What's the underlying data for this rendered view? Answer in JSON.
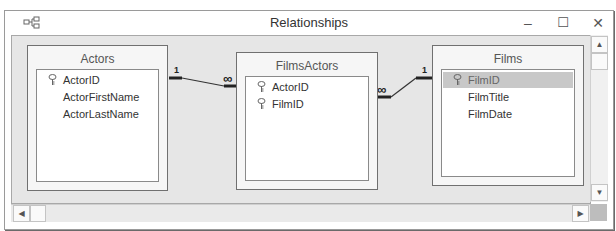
{
  "window": {
    "title": "Relationships",
    "icon": "relationships-icon",
    "controls": {
      "minimize": "–",
      "maximize": "☐",
      "close": "✕"
    }
  },
  "tables": [
    {
      "name": "Actors",
      "fields": [
        {
          "name": "ActorID",
          "primary_key": true,
          "selected": false
        },
        {
          "name": "ActorFirstName",
          "primary_key": false,
          "selected": false
        },
        {
          "name": "ActorLastName",
          "primary_key": false,
          "selected": false
        }
      ]
    },
    {
      "name": "FilmsActors",
      "fields": [
        {
          "name": "ActorID",
          "primary_key": true,
          "selected": false
        },
        {
          "name": "FilmID",
          "primary_key": true,
          "selected": false
        }
      ]
    },
    {
      "name": "Films",
      "fields": [
        {
          "name": "FilmID",
          "primary_key": true,
          "selected": true
        },
        {
          "name": "FilmTitle",
          "primary_key": false,
          "selected": false
        },
        {
          "name": "FilmDate",
          "primary_key": false,
          "selected": false
        }
      ]
    }
  ],
  "relationships": [
    {
      "from": "Actors.ActorID",
      "to": "FilmsActors.ActorID",
      "from_label": "1",
      "to_label": "∞"
    },
    {
      "from": "Films.FilmID",
      "to": "FilmsActors.FilmID",
      "from_label": "1",
      "to_label": "∞"
    }
  ],
  "scrollbars": {
    "up": "▲",
    "down": "▼",
    "left": "◀",
    "right": "▶"
  }
}
